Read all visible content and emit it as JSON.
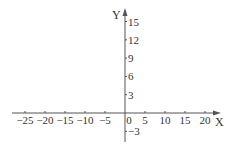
{
  "chart_data": {
    "type": "line",
    "title": "",
    "xlabel": "X",
    "ylabel": "Y",
    "xlim": [
      -28,
      23
    ],
    "ylim": [
      -4,
      17
    ],
    "grid": false,
    "x_ticks": [
      -25,
      -20,
      -15,
      -10,
      -5,
      0,
      5,
      10,
      15,
      20
    ],
    "x_tick_labels": [
      "−25",
      "−20",
      "−15",
      "−10",
      "−5",
      "0",
      "5",
      "10",
      "15",
      "20"
    ],
    "y_ticks": [
      15,
      12,
      9,
      6,
      3,
      -3
    ],
    "y_tick_labels": [
      "15",
      "12",
      "9",
      "6",
      "3",
      "−3"
    ],
    "series": []
  },
  "axes": {
    "x_label": "X",
    "y_label": "Y",
    "origin_label": "0",
    "color": "#555555"
  }
}
